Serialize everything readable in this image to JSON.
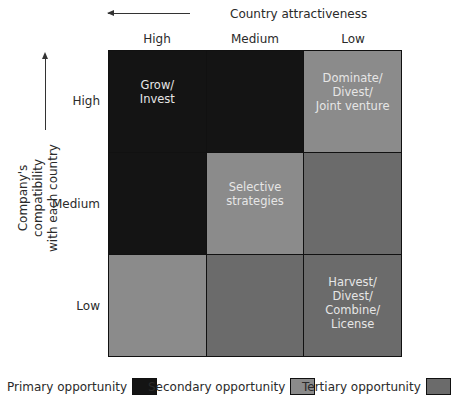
{
  "x_axis": {
    "label": "Country attractiveness",
    "direction": "left",
    "categories": [
      "High",
      "Medium",
      "Low"
    ]
  },
  "y_axis": {
    "label_line1": "Company's compatibility",
    "label_line2": "with each country",
    "direction": "up",
    "categories": [
      "High",
      "Medium",
      "Low"
    ]
  },
  "colors": {
    "primary": "#141414",
    "secondary": "#8b8b8b",
    "tertiary": "#6b6b6b"
  },
  "cells": [
    {
      "row": "High",
      "col": "High",
      "type": "primary",
      "text": "Grow/\nInvest"
    },
    {
      "row": "High",
      "col": "Medium",
      "type": "primary",
      "text": ""
    },
    {
      "row": "High",
      "col": "Low",
      "type": "secondary",
      "text": "Dominate/\nDivest/\nJoint venture"
    },
    {
      "row": "Medium",
      "col": "High",
      "type": "primary",
      "text": ""
    },
    {
      "row": "Medium",
      "col": "Medium",
      "type": "secondary",
      "text": "Selective\nstrategies"
    },
    {
      "row": "Medium",
      "col": "Low",
      "type": "tertiary",
      "text": ""
    },
    {
      "row": "Low",
      "col": "High",
      "type": "secondary",
      "text": ""
    },
    {
      "row": "Low",
      "col": "Medium",
      "type": "tertiary",
      "text": ""
    },
    {
      "row": "Low",
      "col": "Low",
      "type": "tertiary",
      "text": "Harvest/\nDivest/\nCombine/\nLicense"
    }
  ],
  "legend": [
    {
      "label": "Primary opportunity",
      "type": "primary"
    },
    {
      "label": "Secondary opportunity",
      "type": "secondary"
    },
    {
      "label": "Tertiary opportunity",
      "type": "tertiary"
    }
  ]
}
